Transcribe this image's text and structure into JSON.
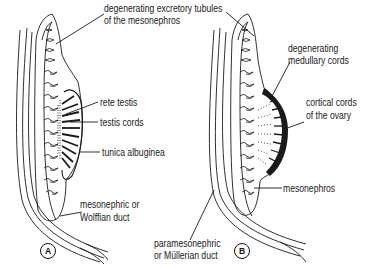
{
  "figure": {
    "panels": [
      {
        "id": "A",
        "label": "A",
        "subject": "developing testis"
      },
      {
        "id": "B",
        "label": "B",
        "subject": "developing ovary"
      }
    ],
    "labels": {
      "top": [
        "degenerating excretory tubules",
        "of the mesonephros"
      ],
      "rete_testis": "rete testis",
      "testis_cords": "testis cords",
      "tunica_albuginea": "tunica albuginea",
      "wolffian": [
        "mesonephric or",
        "Wolffian duct"
      ],
      "medullary": [
        "degenerating",
        "medullary cords"
      ],
      "cortical": [
        "cortical cords",
        "of the ovary"
      ],
      "mesonephros": "mesonephros",
      "mullerian": [
        "paramesonephric",
        "or Müllerian duct"
      ]
    },
    "colors": {
      "line": "#1a1a1a",
      "background": "#ffffff"
    }
  }
}
